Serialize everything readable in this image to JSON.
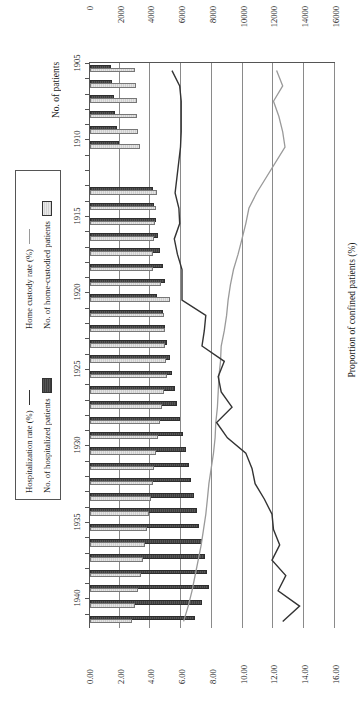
{
  "chart_data": {
    "type": "bar",
    "title": "",
    "orientation": "image rotated 90 degrees; text reads bottom-to-top",
    "xlabel": "",
    "ylabel": "No. of patients",
    "y2label": "Proportion of confined patients (%)",
    "ylim": [
      0,
      16000
    ],
    "y2lim": [
      0,
      16.0
    ],
    "yticks": [
      "0",
      "2000",
      "4000",
      "6000",
      "8000",
      "10000",
      "12000",
      "14000",
      "16000"
    ],
    "y2ticks": [
      "0.00",
      "2.00",
      "4.00",
      "6.00",
      "8.00",
      "10.00",
      "12.00",
      "14.00",
      "16.00"
    ],
    "xticks": [
      "1905",
      "1910",
      "1915",
      "1920",
      "1925",
      "1930",
      "1935",
      "1940"
    ],
    "grid": true,
    "legend_position": "bottom-right",
    "legend": [
      "No. of hospitalized patients",
      "No. of home-custodied patients",
      "Hospitalization rate (%)",
      "Home custody rate (%)"
    ],
    "x": [
      1905,
      1906,
      1907,
      1908,
      1909,
      1910,
      1911,
      1912,
      1913,
      1914,
      1915,
      1916,
      1917,
      1918,
      1919,
      1920,
      1921,
      1922,
      1923,
      1924,
      1925,
      1926,
      1927,
      1928,
      1929,
      1930,
      1931,
      1932,
      1933,
      1934,
      1935,
      1936,
      1937,
      1938,
      1939,
      1940,
      1941
    ],
    "series": [
      {
        "name": "No. of hospitalized patients",
        "type": "bar",
        "axis": "left",
        "color": "#4a4a4a",
        "values": [
          1250,
          1330,
          1420,
          1520,
          1600,
          1730,
          null,
          null,
          3950,
          4050,
          4180,
          4320,
          4450,
          4600,
          4750,
          4200,
          4620,
          4760,
          4900,
          5050,
          5200,
          5380,
          5560,
          5740,
          5900,
          6100,
          6280,
          6450,
          6620,
          6800,
          6980,
          7150,
          7320,
          7480,
          7600,
          7150,
          6700
        ]
      },
      {
        "name": "No. of home-custodied patients",
        "type": "bar",
        "axis": "left",
        "color": "#d8d8d8",
        "values": [
          2800,
          2840,
          2900,
          2950,
          3000,
          3100,
          null,
          null,
          4250,
          4180,
          4120,
          4060,
          4000,
          3950,
          4500,
          5050,
          4700,
          4720,
          4760,
          4800,
          4850,
          4700,
          4560,
          4420,
          4300,
          4180,
          4060,
          3940,
          3820,
          3700,
          3580,
          3440,
          3300,
          3160,
          3000,
          2800,
          2600
        ]
      },
      {
        "name": "Hospitalization rate (%)",
        "type": "line",
        "axis": "right",
        "color": "#333333",
        "values": [
          5.4,
          5.9,
          6.0,
          6.0,
          6.0,
          5.95,
          null,
          null,
          5.6,
          5.85,
          5.9,
          5.55,
          5.75,
          6.05,
          6.05,
          6.05,
          7.6,
          7.5,
          7.35,
          8.8,
          8.4,
          8.6,
          9.3,
          8.3,
          9.0,
          10.2,
          10.6,
          10.8,
          11.4,
          11.9,
          12.0,
          12.4,
          11.9,
          12.8,
          12.3,
          13.7,
          12.6
        ]
      },
      {
        "name": "Home custody rate (%)",
        "type": "line",
        "axis": "right",
        "color": "#9a9a9a",
        "values": [
          12.2,
          12.6,
          12.0,
          12.35,
          12.6,
          12.75,
          null,
          null,
          10.9,
          10.4,
          10.2,
          9.95,
          9.7,
          9.4,
          9.2,
          9.05,
          8.95,
          8.8,
          8.6,
          8.55,
          8.45,
          8.4,
          8.35,
          8.25,
          8.2,
          8.1,
          7.95,
          7.8,
          7.7,
          7.6,
          7.45,
          7.3,
          7.1,
          6.9,
          6.7,
          6.45,
          6.15
        ]
      }
    ]
  },
  "axes": {
    "left_title": "No. of patients",
    "right_title": "Proportion of confined patients (%)"
  },
  "legend": {
    "items": [
      {
        "label": "No. of hospitalized patients",
        "marker": "bar-dark"
      },
      {
        "label": "Hospitalization rate (%)",
        "marker": "line-dark"
      },
      {
        "label": "No. of home-custodied patients",
        "marker": "bar-light"
      },
      {
        "label": "Home custody rate (%)",
        "marker": "line-gray"
      }
    ]
  }
}
